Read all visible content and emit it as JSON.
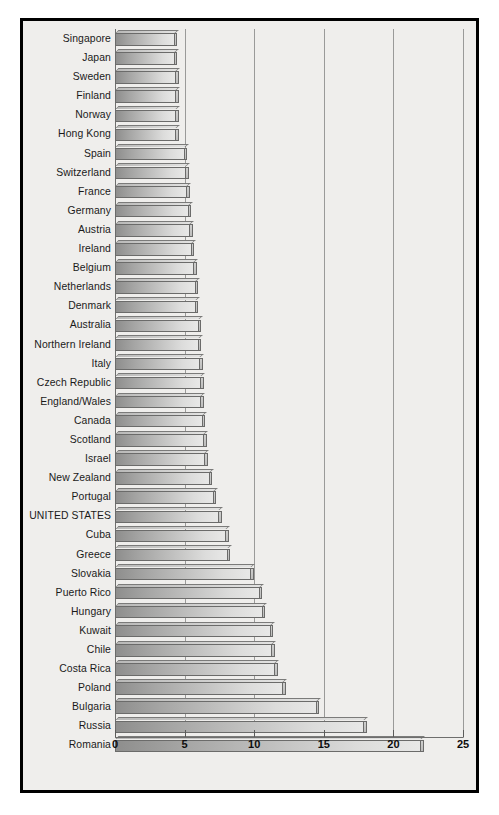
{
  "chart_data": {
    "type": "bar",
    "orientation": "horizontal",
    "title": "",
    "xlabel": "",
    "ylabel": "",
    "xlim": [
      0,
      25
    ],
    "xticks": [
      0,
      5,
      10,
      15,
      20,
      25
    ],
    "xtick_labels": [
      "0",
      "5",
      "10",
      "15",
      "20",
      "25"
    ],
    "grid": true,
    "gridlines_at": [
      5,
      10,
      15,
      20,
      25
    ],
    "legend": "none",
    "highlight_category": "UNITED STATES",
    "categories": [
      "Singapore",
      "Japan",
      "Sweden",
      "Finland",
      "Norway",
      "Hong Kong",
      "Spain",
      "Switzerland",
      "France",
      "Germany",
      "Austria",
      "Ireland",
      "Belgium",
      "Netherlands",
      "Denmark",
      "Australia",
      "Northern Ireland",
      "Italy",
      "Czech Republic",
      "England/Wales",
      "Canada",
      "Scotland",
      "Israel",
      "New Zealand",
      "Portugal",
      "UNITED STATES",
      "Cuba",
      "Greece",
      "Slovakia",
      "Puerto Rico",
      "Hungary",
      "Kuwait",
      "Chile",
      "Costa Rica",
      "Poland",
      "Bulgaria",
      "Russia",
      "Romania"
    ],
    "values": [
      4.3,
      4.3,
      4.4,
      4.4,
      4.4,
      4.4,
      5.0,
      5.1,
      5.2,
      5.3,
      5.4,
      5.5,
      5.7,
      5.8,
      5.8,
      6.0,
      6.0,
      6.1,
      6.2,
      6.2,
      6.3,
      6.4,
      6.5,
      6.8,
      7.1,
      7.5,
      8.0,
      8.1,
      9.8,
      10.4,
      10.6,
      11.2,
      11.3,
      11.5,
      12.1,
      14.5,
      17.9,
      22.0
    ]
  },
  "caption": {
    "text": ""
  },
  "icons": {
    "axis": "x-axis",
    "grid": "gridlines"
  }
}
